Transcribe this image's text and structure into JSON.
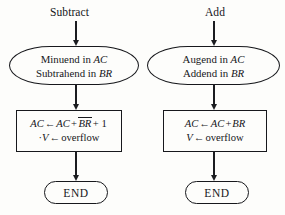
{
  "diagram": {
    "background_color": "#fdfdfb",
    "line_color": "#17181c",
    "columns": [
      {
        "id": "subtract",
        "start_label": "Subtract",
        "io": {
          "line1_a": "Minuend in ",
          "line1_b": "AC",
          "line2_a": "Subtrahend in ",
          "line2_b": "BR"
        },
        "process": {
          "line1_p1": "AC",
          "line1_arrow": "←",
          "line1_p2": "AC",
          "line1_plus1": "+",
          "line1_overline": "BR",
          "line1_tail": "+ 1",
          "line2_dot": "·",
          "line2_v": "V",
          "line2_arrow": "←",
          "line2_tail": "overflow"
        },
        "terminal": "END"
      },
      {
        "id": "add",
        "start_label": "Add",
        "io": {
          "line1_a": "Augend in ",
          "line1_b": "AC",
          "line2_a": "Addend in ",
          "line2_b": "BR"
        },
        "process": {
          "line1_p1": "AC",
          "line1_arrow": "←",
          "line1_p2": "AC",
          "line1_plus1": "+",
          "line1_overline": "BR",
          "line1_tail": "",
          "line2_dot": "",
          "line2_v": "V",
          "line2_arrow": "←",
          "line2_tail": "overflow"
        },
        "terminal": "END"
      }
    ]
  }
}
